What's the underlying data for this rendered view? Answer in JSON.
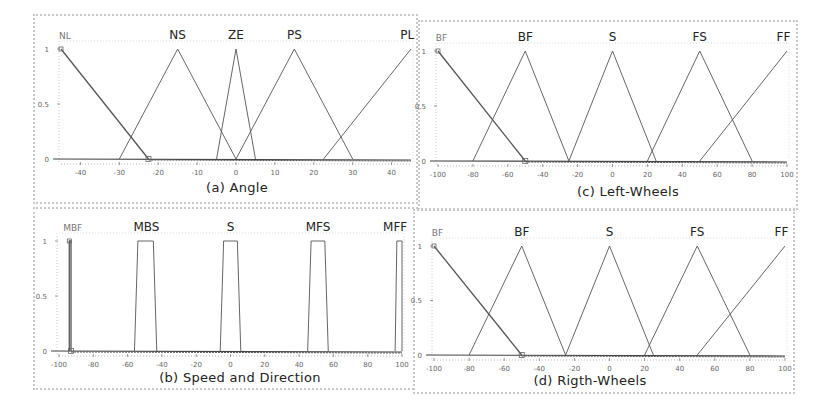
{
  "figure": {
    "background": "#ffffff",
    "border_color": "#c8c8c8",
    "line_color": "#555555",
    "axis_color": "#444444"
  },
  "panels": [
    {
      "id": "a",
      "caption": "(a) Angle",
      "box": {
        "left": 33,
        "top": 14,
        "width": 385,
        "height": 190
      },
      "plot": {
        "x0": 26,
        "x1": 376,
        "y0": 143,
        "y1": 33
      },
      "xlim": [
        -45,
        45
      ],
      "x_ticks": [
        -40,
        -30,
        -20,
        -10,
        0,
        10,
        20,
        30,
        40
      ],
      "y_ticks": [
        {
          "v": 0,
          "label": "0"
        },
        {
          "v": 0.5,
          "label": "0.5"
        },
        {
          "v": 1,
          "label": "1"
        }
      ],
      "caption_pos": {
        "x": 202,
        "y": 164
      }
    },
    {
      "id": "c",
      "caption": "(c) Left-Wheels",
      "box": {
        "left": 418,
        "top": 20,
        "width": 380,
        "height": 190
      },
      "plot": {
        "x0": 18,
        "x1": 367,
        "y0": 139,
        "y1": 29
      },
      "xlim": [
        -100,
        100
      ],
      "x_ticks": [
        -100,
        -80,
        -60,
        -40,
        -20,
        0,
        20,
        40,
        60,
        80,
        100
      ],
      "y_ticks": [
        {
          "v": 0,
          "label": "0"
        },
        {
          "v": 0.5,
          "label": "0.5"
        },
        {
          "v": 1,
          "label": "1"
        }
      ],
      "caption_pos": {
        "x": 208,
        "y": 162
      }
    },
    {
      "id": "b",
      "caption": "(b) Speed and Direction",
      "box": {
        "left": 33,
        "top": 207,
        "width": 385,
        "height": 183
      },
      "plot": {
        "x0": 24,
        "x1": 367,
        "y0": 142,
        "y1": 32
      },
      "xlim": [
        -100,
        100
      ],
      "x_ticks": [
        -100,
        -80,
        -60,
        -40,
        -20,
        0,
        20,
        40,
        60,
        80,
        100
      ],
      "y_ticks": [
        {
          "v": 0,
          "label": "0"
        },
        {
          "v": 0.5,
          "label": "0.5"
        },
        {
          "v": 1,
          "label": "1"
        }
      ],
      "caption_pos": {
        "x": 205,
        "y": 161
      }
    },
    {
      "id": "d",
      "caption": "(d) Rigth-Wheels",
      "box": {
        "left": 413,
        "top": 209,
        "width": 382,
        "height": 185
      },
      "plot": {
        "x0": 19,
        "x1": 370,
        "y0": 144,
        "y1": 35
      },
      "xlim": [
        -100,
        100
      ],
      "x_ticks": [
        -100,
        -80,
        -60,
        -40,
        -20,
        0,
        20,
        40,
        60,
        80,
        100
      ],
      "y_ticks": [
        {
          "v": 0,
          "label": "0"
        },
        {
          "v": 0.5,
          "label": "0.5"
        },
        {
          "v": 1,
          "label": "1"
        }
      ],
      "caption_pos": {
        "x": 175,
        "y": 162
      }
    }
  ],
  "chart_data": [
    {
      "type": "line",
      "title": "(a) Angle",
      "xlabel": "",
      "ylabel": "",
      "xlim": [
        -45,
        45
      ],
      "ylim": [
        0,
        1
      ],
      "x_tick_labels": [
        "-40",
        "-30",
        "-20",
        "-10",
        "0",
        "10",
        "20",
        "30",
        "40"
      ],
      "y_tick_labels": [
        "0",
        "0.5",
        "1"
      ],
      "grid": false,
      "series": [
        {
          "name": "NL",
          "x": [
            -45,
            -22.5
          ],
          "y": [
            1,
            0
          ],
          "label_x": -44,
          "small_label": true
        },
        {
          "name": "NS",
          "x": [
            -30,
            -15,
            0
          ],
          "y": [
            0,
            1,
            0
          ],
          "label_x": -15
        },
        {
          "name": "ZE",
          "x": [
            -5,
            0,
            5
          ],
          "y": [
            0,
            1,
            0
          ],
          "label_x": 0
        },
        {
          "name": "PS",
          "x": [
            0,
            15,
            30
          ],
          "y": [
            0,
            1,
            0
          ],
          "label_x": 15
        },
        {
          "name": "PL",
          "x": [
            22.5,
            45
          ],
          "y": [
            0,
            1
          ],
          "label_x": 44
        }
      ]
    },
    {
      "type": "line",
      "title": "(c) Left-Wheels",
      "xlabel": "",
      "ylabel": "",
      "xlim": [
        -100,
        100
      ],
      "ylim": [
        0,
        1
      ],
      "x_tick_labels": [
        "-100",
        "-80",
        "-60",
        "-40",
        "-20",
        "0",
        "20",
        "40",
        "60",
        "80",
        "100"
      ],
      "y_tick_labels": [
        "0",
        "0.5",
        "1"
      ],
      "grid": false,
      "series": [
        {
          "name": "BF",
          "x": [
            -100,
            -50
          ],
          "y": [
            1,
            0
          ],
          "label_x": -98,
          "small_label": true
        },
        {
          "name": "BF",
          "x": [
            -80,
            -50,
            -25
          ],
          "y": [
            0,
            1,
            0
          ],
          "label_x": -50
        },
        {
          "name": "S",
          "x": [
            -25,
            0,
            25
          ],
          "y": [
            0,
            1,
            0
          ],
          "label_x": 0
        },
        {
          "name": "FS",
          "x": [
            20,
            50,
            80
          ],
          "y": [
            0,
            1,
            0
          ],
          "label_x": 50
        },
        {
          "name": "FF",
          "x": [
            50,
            100
          ],
          "y": [
            0,
            1
          ],
          "label_x": 98
        }
      ]
    },
    {
      "type": "line",
      "title": "(b) Speed and Direction",
      "xlabel": "",
      "ylabel": "",
      "xlim": [
        -100,
        100
      ],
      "ylim": [
        0,
        1
      ],
      "x_tick_labels": [
        "-100",
        "-80",
        "-60",
        "-40",
        "-20",
        "0",
        "20",
        "40",
        "60",
        "80",
        "100"
      ],
      "y_tick_labels": [
        "0",
        "0.5",
        "1"
      ],
      "grid": false,
      "series": [
        {
          "name": "MBF",
          "x": [
            -94,
            -94,
            -93,
            -93
          ],
          "y": [
            0,
            1,
            1,
            0
          ],
          "label_x": -92,
          "small_label": true
        },
        {
          "name": "MBS",
          "x": [
            -56,
            -54,
            -45,
            -43
          ],
          "y": [
            0,
            1,
            1,
            0
          ],
          "label_x": -49
        },
        {
          "name": "S",
          "x": [
            -6,
            -4,
            4,
            6
          ],
          "y": [
            0,
            1,
            1,
            0
          ],
          "label_x": 0
        },
        {
          "name": "MFS",
          "x": [
            45,
            47,
            55,
            57
          ],
          "y": [
            0,
            1,
            1,
            0
          ],
          "label_x": 51
        },
        {
          "name": "MFF",
          "x": [
            96,
            97,
            100,
            100
          ],
          "y": [
            0,
            1,
            1,
            0
          ],
          "label_x": 96
        }
      ]
    },
    {
      "type": "line",
      "title": "(d) Rigth-Wheels",
      "xlabel": "",
      "ylabel": "",
      "xlim": [
        -100,
        100
      ],
      "ylim": [
        0,
        1
      ],
      "x_tick_labels": [
        "-100",
        "-80",
        "-60",
        "-40",
        "-20",
        "0",
        "20",
        "40",
        "60",
        "80",
        "100"
      ],
      "y_tick_labels": [
        "0",
        "0.5",
        "1"
      ],
      "grid": false,
      "series": [
        {
          "name": "BF",
          "x": [
            -100,
            -50
          ],
          "y": [
            1,
            0
          ],
          "label_x": -98,
          "small_label": true
        },
        {
          "name": "BF",
          "x": [
            -80,
            -50,
            -25
          ],
          "y": [
            0,
            1,
            0
          ],
          "label_x": -50
        },
        {
          "name": "S",
          "x": [
            -25,
            0,
            25
          ],
          "y": [
            0,
            1,
            0
          ],
          "label_x": 0
        },
        {
          "name": "FS",
          "x": [
            20,
            50,
            80
          ],
          "y": [
            0,
            1,
            0
          ],
          "label_x": 50
        },
        {
          "name": "FF",
          "x": [
            50,
            100
          ],
          "y": [
            0,
            1
          ],
          "label_x": 98
        }
      ]
    }
  ]
}
